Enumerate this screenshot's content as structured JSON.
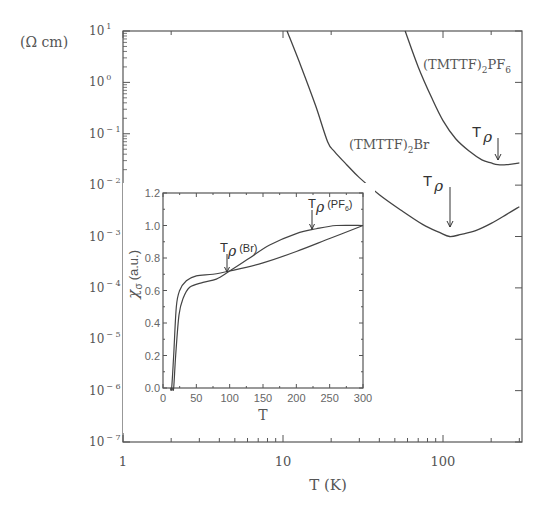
{
  "chart_data": [
    {
      "type": "line",
      "title": "",
      "xlabel": "T (K)",
      "ylabel": "(Ω cm)",
      "xscale": "log",
      "yscale": "log",
      "xlim": [
        1,
        300
      ],
      "ylim": [
        1e-07,
        10
      ],
      "x_ticks": [
        "1",
        "10",
        "100"
      ],
      "y_ticks": [
        "10^1",
        "10^0",
        "10^-1",
        "10^-2",
        "10^-3",
        "10^-4",
        "10^-5",
        "10^-6",
        "10^-7"
      ],
      "grid": false,
      "series": [
        {
          "name": "(TMTTF)2Br",
          "x": [
            10.6,
            13,
            16,
            19,
            21,
            25,
            30,
            40,
            55,
            75,
            95,
            110,
            130,
            160,
            200,
            250,
            300
          ],
          "y": [
            10,
            2.0,
            0.35,
            0.07,
            0.045,
            0.025,
            0.014,
            0.0065,
            0.0032,
            0.0017,
            0.0012,
            0.001,
            0.0011,
            0.0013,
            0.0018,
            0.0027,
            0.0038
          ]
        },
        {
          "name": "(TMTTF)2PF6",
          "x": [
            58,
            70,
            85,
            100,
            120,
            147,
            175,
            200,
            220,
            250,
            300
          ],
          "y": [
            10,
            2.0,
            0.5,
            0.18,
            0.08,
            0.045,
            0.031,
            0.027,
            0.025,
            0.025,
            0.027
          ]
        }
      ],
      "annotations": [
        {
          "text": "(TMTTF)2PF6",
          "x": 150,
          "y": 3
        },
        {
          "text": "(TMTTF)2Br",
          "x": 40,
          "y": 0.05
        },
        {
          "text": "Tρ",
          "arrow_to": {
            "x": 110,
            "y": 0.001
          },
          "series": "(TMTTF)2Br"
        },
        {
          "text": "Tρ",
          "arrow_to": {
            "x": 220,
            "y": 0.025
          },
          "series": "(TMTTF)2PF6"
        }
      ]
    },
    {
      "type": "line",
      "title": "inset",
      "xlabel": "T",
      "ylabel": "χσ (a.u.)",
      "xlim": [
        0,
        300
      ],
      "ylim": [
        0.0,
        1.2
      ],
      "x_ticks": [
        "0",
        "50",
        "100",
        "150",
        "200",
        "250",
        "300"
      ],
      "y_ticks": [
        "0.0",
        "0.2",
        "0.4",
        "0.6",
        "0.8",
        "1.0",
        "1.2"
      ],
      "grid": false,
      "series": [
        {
          "name": "(TMTTF)2Br",
          "x": [
            13,
            16,
            20,
            25,
            35,
            50,
            75,
            100,
            150,
            200,
            250,
            300
          ],
          "y": [
            0.0,
            0.2,
            0.5,
            0.6,
            0.66,
            0.69,
            0.7,
            0.72,
            0.77,
            0.84,
            0.92,
            1.0
          ]
        },
        {
          "name": "(TMTTF)2PF6",
          "x": [
            16,
            19,
            24,
            30,
            40,
            60,
            80,
            100,
            130,
            160,
            200,
            230,
            260,
            300
          ],
          "y": [
            0.0,
            0.2,
            0.45,
            0.55,
            0.62,
            0.65,
            0.67,
            0.72,
            0.8,
            0.88,
            0.95,
            0.98,
            1.0,
            1.0
          ]
        }
      ],
      "annotations": [
        {
          "text": "Tρ (Br)",
          "arrow_to": {
            "x": 95,
            "y": 0.72
          }
        },
        {
          "text": "Tρ (PF6)",
          "arrow_to": {
            "x": 225,
            "y": 0.97
          }
        }
      ]
    }
  ],
  "labels": {
    "y_unit": "(Ω cm)",
    "x_axis": "T (K)",
    "pf6_label": "(TMTTF)",
    "pf6_sub": "2",
    "pf6_tail": "PF",
    "pf6_sub2": "6",
    "br_label": "(TMTTF)",
    "br_sub": "2",
    "br_tail": "Br",
    "t_rho": "T",
    "rho": "ρ",
    "inset_x": "T",
    "inset_y_chi": "χ",
    "inset_y_sigma": "σ",
    "inset_y_unit": "(a.u.)",
    "inset_br": "(Br)",
    "inset_pf6": "(PF",
    "inset_pf6_sub": "6",
    "inset_pf6_close": ")"
  },
  "colors": {
    "axis": "#555555",
    "curve": "#444444",
    "text": "#555555"
  }
}
